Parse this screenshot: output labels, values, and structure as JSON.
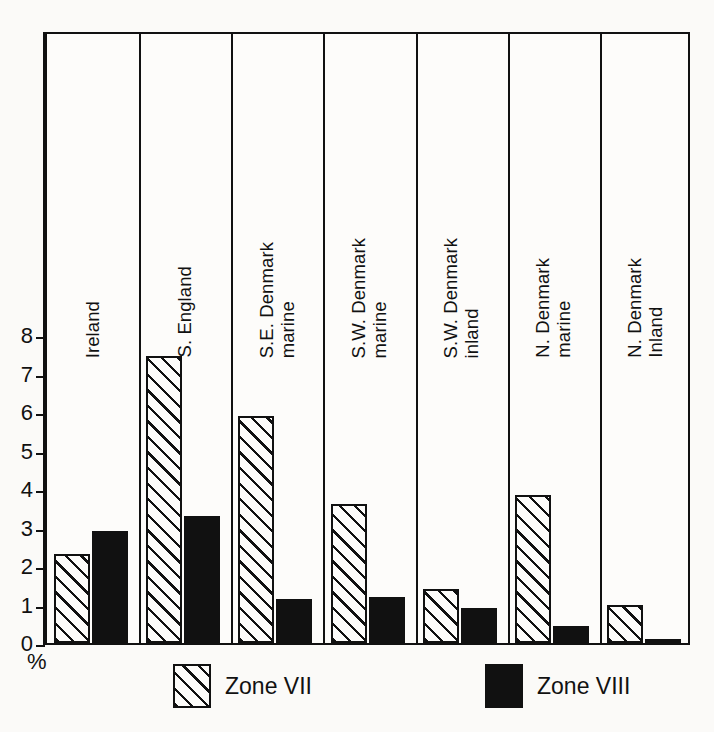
{
  "chart_data": {
    "type": "bar",
    "title": "",
    "subtitle": "",
    "xlabel": "",
    "ylabel": "%",
    "ylim": [
      0,
      8.3
    ],
    "yticks": [
      0,
      1,
      2,
      3,
      4,
      5,
      6,
      7,
      8
    ],
    "ytick_labels": [
      "0",
      "1",
      "2",
      "3",
      "4",
      "5",
      "6",
      "7",
      "8"
    ],
    "grid": false,
    "legend_position": "bottom",
    "categories": [
      "Ireland",
      "S. England",
      "S.E. Denmark marine",
      "S.W. Denmark marine",
      "S.W. Denmark inland",
      "N. Denmark marine",
      "N. Denmark Inland"
    ],
    "category_label_lines": [
      [
        "Ireland"
      ],
      [
        "S. England"
      ],
      [
        "S.E. Denmark",
        "marine"
      ],
      [
        "S.W. Denmark",
        "marine"
      ],
      [
        "S.W. Denmark",
        "inland"
      ],
      [
        "N. Denmark",
        "marine"
      ],
      [
        "N. Denmark",
        "Inland"
      ]
    ],
    "series": [
      {
        "name": "Zone VII",
        "fill": "diagonal-hatch",
        "color": "#111111",
        "values": [
          2.3,
          7.45,
          5.9,
          3.6,
          1.4,
          3.85,
          1.0
        ]
      },
      {
        "name": "Zone VIII",
        "fill": "solid",
        "color": "#111111",
        "values": [
          2.9,
          3.3,
          1.15,
          1.2,
          0.9,
          0.45,
          0.05
        ]
      }
    ]
  },
  "axis": {
    "y_unit_label": "%"
  },
  "legend": {
    "entries": [
      {
        "label": "Zone VII",
        "swatch": "hatched-swatch"
      },
      {
        "label": "Zone VIII",
        "swatch": "solid-black-swatch"
      }
    ]
  },
  "colors": {
    "ink": "#111111",
    "paper": "#fbfaf8",
    "panel": "#fdfcfa"
  }
}
